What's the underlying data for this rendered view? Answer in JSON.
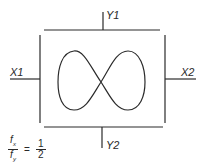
{
  "diagram": {
    "labels": {
      "top": "Y1",
      "bottom": "Y2",
      "left": "X1",
      "right": "X2"
    },
    "ratio": {
      "numerator": "fx",
      "denominator": "fy",
      "num_sym": "f",
      "num_sub": "x",
      "den_sym": "f",
      "den_sub": "y",
      "equals": "=",
      "value_numerator": "1",
      "value_denominator": "2"
    },
    "colors": {
      "stroke": "#2a2a2a",
      "background": "#ffffff"
    }
  }
}
